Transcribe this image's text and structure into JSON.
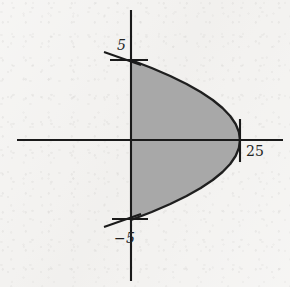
{
  "figure": {
    "background_color": "#f3f2f0",
    "ink_color": "#1a1a1a",
    "fill_color": "#a8a8a8",
    "width": 290,
    "height": 287
  },
  "axes": {
    "x_axis": {
      "name": "horizontal-axis",
      "y_pixel": 140,
      "x_start_pixel": 17,
      "x_end_pixel": 283
    },
    "y_axis": {
      "name": "vertical-axis",
      "x_pixel": 131,
      "y_start_pixel": 10,
      "y_end_pixel": 281
    },
    "origin_pixel": [
      131,
      140
    ]
  },
  "ticks": [
    {
      "id": "tick-y-pos5",
      "axis": "y",
      "value": 5,
      "label": "5",
      "pixel": [
        131,
        60
      ]
    },
    {
      "id": "tick-y-neg5",
      "axis": "y",
      "value": -5,
      "label": "−5",
      "pixel": [
        131,
        219
      ]
    },
    {
      "id": "tick-x-25",
      "axis": "x",
      "value": 25,
      "label": "25",
      "pixel": [
        240,
        140
      ]
    }
  ],
  "labels": {
    "y_positive_five": "5",
    "y_negative_five": "−5",
    "x_twenty_five": "25"
  },
  "chart_data": {
    "type": "line",
    "xlabel": "x",
    "ylabel": "y",
    "grid": false,
    "legend": null,
    "xlim": [
      -4.6,
      35.4
    ],
    "ylim": [
      -8.2,
      8.2
    ],
    "xticks": [
      25
    ],
    "xticklabels": [
      "25"
    ],
    "yticks": [
      5,
      -5
    ],
    "yticklabels": [
      "5",
      "−5"
    ],
    "shaded_region": {
      "label": "shaded-parabolic-region",
      "fill_color": "#a8a8a8",
      "edge_color": "#1f1f1f",
      "bounded_left_by": "y-axis (x = 0)",
      "bounded_right_by": "parabola x = 25 − y²",
      "vertex": [
        25,
        0
      ],
      "y_intercepts": [
        [
          0,
          5
        ],
        [
          0,
          -5
        ]
      ]
    },
    "series": [
      {
        "name": "parabola x = 25 - y^2",
        "orientation": "opens-left",
        "y": [
          5,
          4.5,
          4,
          3.5,
          3,
          2.5,
          2,
          1.5,
          1,
          0.5,
          0,
          -0.5,
          -1,
          -1.5,
          -2,
          -2.5,
          -3,
          -3.5,
          -4,
          -4.5,
          -5
        ],
        "x": [
          0,
          4.75,
          9,
          12.75,
          16,
          18.75,
          21,
          22.75,
          24,
          24.75,
          25,
          24.75,
          24,
          22.75,
          21,
          18.75,
          16,
          12.75,
          9,
          4.75,
          0
        ]
      }
    ]
  }
}
